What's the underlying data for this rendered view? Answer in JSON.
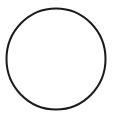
{
  "canvas": {
    "width": 117,
    "height": 121,
    "background_color": "#ffffff",
    "title": "Circle outline"
  },
  "figure": {
    "type": "geometric-shape",
    "shape_name": "circle",
    "label": "",
    "interior_text": "",
    "shapes": [
      {
        "name": "circle-outline",
        "kind": "circle",
        "center_x": 56,
        "center_y": 59,
        "radius_x": 49.5,
        "radius_y": 50.5,
        "stroke_color": "#1a1a1a",
        "stroke_width": 2,
        "fill": "none"
      }
    ]
  }
}
